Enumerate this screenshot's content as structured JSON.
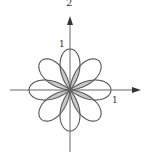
{
  "figure": {
    "title": "2",
    "y_tick_label": "1",
    "x_tick_label": "1"
  },
  "chart_data": {
    "type": "polar-curve",
    "petals": 8,
    "petal_angles_deg": [
      0,
      45,
      90,
      135,
      180,
      225,
      270,
      315
    ],
    "petal_length": 1,
    "shaded_region": "overlap of adjacent petals near origin",
    "axes": {
      "x_tick": 1,
      "y_tick": 1,
      "arrows": true
    },
    "colors": {
      "curve": "#555555",
      "shade": "#c8c8c8",
      "axis": "#666666"
    }
  }
}
